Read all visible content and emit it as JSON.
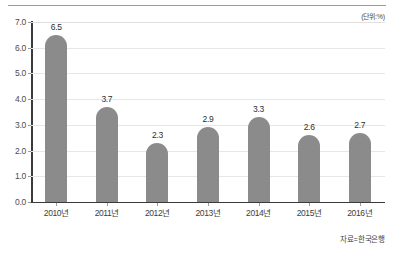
{
  "unit_caption": "(단위:%)",
  "source_caption": "자료=한국은행",
  "colors": {
    "bar": "#8b8b8b",
    "axis": "#3a3a3a",
    "grid": "#e7e7e7",
    "rule": "#9a9a9a"
  },
  "chart_data": {
    "type": "bar",
    "title": "",
    "subtitle": "",
    "xlabel": "",
    "ylabel": "",
    "unit": "%",
    "categories": [
      "2010년",
      "2011년",
      "2012년",
      "2013년",
      "2014년",
      "2015년",
      "2016년"
    ],
    "values": [
      6.5,
      3.7,
      2.3,
      2.9,
      3.3,
      2.6,
      2.7
    ],
    "value_labels": [
      "6.5",
      "3.7",
      "2.3",
      "2.9",
      "3.3",
      "2.6",
      "2.7"
    ],
    "ylim": [
      0.0,
      7.0
    ],
    "ytick_values": [
      0.0,
      1.0,
      2.0,
      3.0,
      4.0,
      5.0,
      6.0,
      7.0
    ],
    "ytick_labels": [
      "0.0",
      "1.0",
      "2.0",
      "3.0",
      "4.0",
      "5.0",
      "6.0",
      "7.0"
    ],
    "grid": true,
    "grid_axis": "y",
    "legend": false,
    "legend_position": "none",
    "series": [
      {
        "name": "",
        "values": [
          6.5,
          3.7,
          2.3,
          2.9,
          3.3,
          2.6,
          2.7
        ]
      }
    ],
    "annotations": [
      {
        "text": "(단위:%)",
        "position": "top-right"
      },
      {
        "text": "자료=한국은행",
        "position": "bottom-right"
      }
    ]
  }
}
